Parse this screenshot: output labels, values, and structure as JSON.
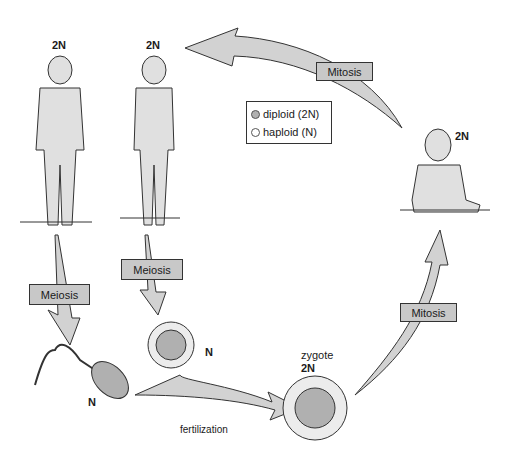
{
  "figures": {
    "man": {
      "ploidy": "2N"
    },
    "woman": {
      "ploidy": "2N"
    },
    "baby": {
      "ploidy": "2N"
    },
    "sperm": {
      "ploidy": "N"
    },
    "egg": {
      "ploidy": "N"
    },
    "zygote": {
      "name": "zygote",
      "ploidy": "2N"
    }
  },
  "arrows": {
    "mitosis_top": "Mitosis",
    "mitosis_right": "Mitosis",
    "meiosis_male": "Meiosis",
    "meiosis_female": "Meiosis",
    "fertilization": "fertilization"
  },
  "legend": {
    "items": [
      {
        "label": "diploid (2N)",
        "color": "#b0b0b0"
      },
      {
        "label": "haploid (N)",
        "color": "#ffffff"
      }
    ]
  },
  "colors": {
    "arrow_fill": "#d2d2d2",
    "label_box": "#c8c8c8",
    "figure_fill": "#e0e0e0"
  }
}
